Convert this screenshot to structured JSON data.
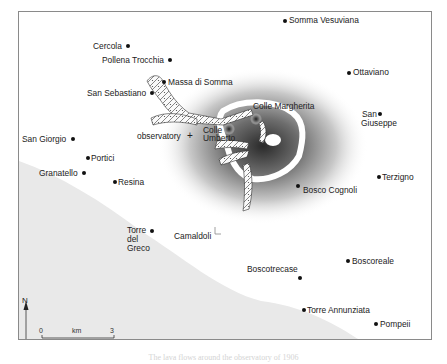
{
  "map": {
    "title_caption": "The lava flows around the observatory of 1906",
    "colors": {
      "sea": "#e9e9e9",
      "land": "#ffffff",
      "crater_shading": "#3a3a3a",
      "frame": "#8a8a8a",
      "text": "#222222"
    },
    "places": [
      {
        "name": "Somma Vesuviana",
        "x": 285,
        "y": 20
      },
      {
        "name": "Cercola",
        "x": 128,
        "y": 46
      },
      {
        "name": "Pollena Trocchia",
        "x": 170,
        "y": 60
      },
      {
        "name": "Massa di Somma",
        "x": 164,
        "y": 82
      },
      {
        "name": "San Sebastiano",
        "x": 152,
        "y": 93
      },
      {
        "name": "Ottaviano",
        "x": 349,
        "y": 72
      },
      {
        "name": "Colle Margherita",
        "x": 252,
        "y": 108
      },
      {
        "name": "San Giuseppe",
        "x": 379,
        "y": 117
      },
      {
        "name": "observatory",
        "x": 200,
        "y": 136
      },
      {
        "name": "Colle Umberto",
        "x": 215,
        "y": 130
      },
      {
        "name": "San Giorgio",
        "x": 73,
        "y": 139
      },
      {
        "name": "Portici",
        "x": 87,
        "y": 159
      },
      {
        "name": "Granatello",
        "x": 84,
        "y": 173
      },
      {
        "name": "Resina",
        "x": 114,
        "y": 182
      },
      {
        "name": "Terzigno",
        "x": 380,
        "y": 177
      },
      {
        "name": "Bosco Cognoli",
        "x": 298,
        "y": 186
      },
      {
        "name": "Torre del Greco",
        "x": 151,
        "y": 230
      },
      {
        "name": "Camaldoli",
        "x": 200,
        "y": 236
      },
      {
        "name": "Boscoreale",
        "x": 348,
        "y": 262
      },
      {
        "name": "Boscotrecase",
        "x": 299,
        "y": 278
      },
      {
        "name": "Torre Annunziata",
        "x": 303,
        "y": 310
      },
      {
        "name": "Pompeii",
        "x": 376,
        "y": 324
      }
    ],
    "labels": {
      "somma_vesuviana": "Somma Vesuviana",
      "cercola": "Cercola",
      "pollena_trocchia": "Pollena Trocchia",
      "massa_di_somma": "Massa di Somma",
      "san_sebastiano": "San Sebastiano",
      "ottaviano": "Ottaviano",
      "colle_margherita": "Colle Margherita",
      "san": "San",
      "giuseppe": "Giuseppe",
      "observatory": "observatory",
      "colle": "Colle",
      "umberto": "Umberto",
      "san_giorgio": "San Giorgio",
      "portici": "Portici",
      "granatello": "Granatello",
      "resina": "Resina",
      "terzigno": "Terzigno",
      "bosco_cognoli": "Bosco Cognoli",
      "torre": "Torre",
      "del": "del",
      "greco": "Greco",
      "camaldoli": "Camaldoli",
      "boscoreale": "Boscoreale",
      "boscotrecase": "Boscotrecase",
      "torre_annunziata": "Torre Annunziata",
      "pompeii": "Pompeii"
    },
    "north_arrow": {
      "label": "N"
    },
    "scale_bar": {
      "start": "0",
      "unit": "km",
      "end": "3"
    },
    "symbols": {
      "observatory_marker": "+"
    }
  }
}
